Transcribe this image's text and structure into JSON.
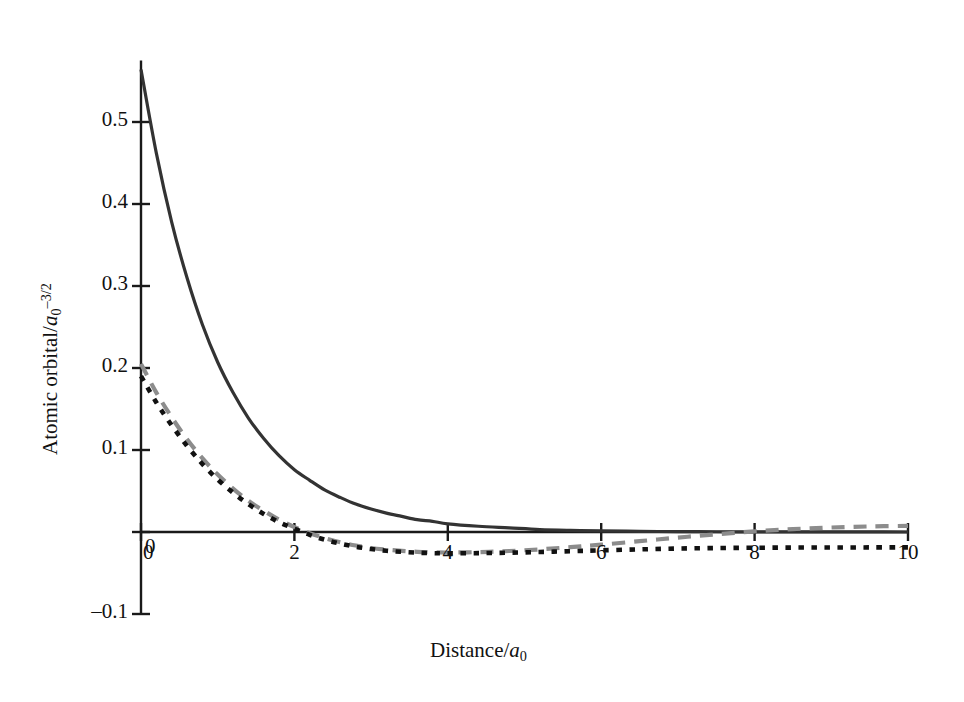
{
  "figure": {
    "background_color": "#ffffff",
    "ink_color": "#1a1a1a",
    "gray_color": "#8c8c8c"
  },
  "axes": {
    "x_title_plain": "Distance/a",
    "x_title_sub": "0",
    "y_title_plain": "Atomic orbital/a",
    "y_title_sub": "0",
    "y_title_sup": "–3/2",
    "x_ticks": [
      "0",
      "2",
      "4",
      "6",
      "8",
      "10"
    ],
    "y_ticks": [
      "0.5",
      "0.4",
      "0.3",
      "0.2",
      "0.1",
      "0",
      "–0.1"
    ]
  },
  "chart_data": {
    "type": "line",
    "title": "",
    "subtitle": "",
    "xlabel": "Distance/a0",
    "ylabel": "Atomic orbital/a0^-3/2",
    "xlim": [
      0,
      10
    ],
    "ylim": [
      -0.1,
      0.58
    ],
    "xticks": [
      0,
      2,
      4,
      6,
      8,
      10
    ],
    "yticks": [
      -0.1,
      0,
      0.1,
      0.2,
      0.3,
      0.4,
      0.5
    ],
    "grid": false,
    "legend": "none",
    "x": [
      0,
      0.2,
      0.4,
      0.6,
      0.8,
      1.0,
      1.2,
      1.4,
      1.6,
      1.8,
      2.0,
      2.2,
      2.4,
      2.6,
      2.8,
      3.0,
      3.2,
      3.4,
      3.6,
      3.8,
      4.0,
      4.4,
      4.8,
      5.2,
      5.6,
      6.0,
      6.5,
      7.0,
      7.5,
      8.0,
      8.5,
      9.0,
      9.5,
      10.0
    ],
    "series": [
      {
        "name": "1s orbital (solid dark)",
        "style": "solid",
        "color": "#333333",
        "linewidth": 3.2,
        "values": [
          0.564,
          0.462,
          0.378,
          0.31,
          0.253,
          0.207,
          0.17,
          0.139,
          0.114,
          0.093,
          0.076,
          0.063,
          0.051,
          0.042,
          0.034,
          0.028,
          0.023,
          0.019,
          0.015,
          0.013,
          0.01,
          0.007,
          0.005,
          0.003,
          0.002,
          0.0014,
          0.0008,
          0.0005,
          0.0003,
          0.0002,
          0.0001,
          7e-05,
          4e-05,
          3e-05
        ]
      },
      {
        "name": "2s orbital (gray dashed)",
        "style": "dashed",
        "color": "#8c8c8c",
        "linewidth": 4.2,
        "values": [
          0.205,
          0.17,
          0.14,
          0.113,
          0.09,
          0.07,
          0.053,
          0.038,
          0.026,
          0.015,
          0.006,
          -0.0015,
          -0.0075,
          -0.0125,
          -0.0165,
          -0.0195,
          -0.0215,
          -0.023,
          -0.0242,
          -0.0248,
          -0.025,
          -0.0245,
          -0.0232,
          -0.0212,
          -0.0185,
          -0.0155,
          -0.0112,
          -0.0068,
          -0.0028,
          0.0008,
          0.0035,
          0.0055,
          0.0068,
          0.0075
        ]
      },
      {
        "name": "2s orbital variant (black dotted)",
        "style": "dotted",
        "color": "#111111",
        "linewidth": 4.6,
        "values": [
          0.19,
          0.158,
          0.13,
          0.105,
          0.083,
          0.064,
          0.048,
          0.034,
          0.022,
          0.012,
          0.004,
          -0.0035,
          -0.0095,
          -0.0142,
          -0.018,
          -0.0208,
          -0.0228,
          -0.0242,
          -0.0252,
          -0.0258,
          -0.026,
          -0.0258,
          -0.0252,
          -0.0244,
          -0.0234,
          -0.0224,
          -0.0212,
          -0.0202,
          -0.0196,
          -0.0192,
          -0.019,
          -0.0189,
          -0.0188,
          -0.0188
        ]
      }
    ]
  }
}
